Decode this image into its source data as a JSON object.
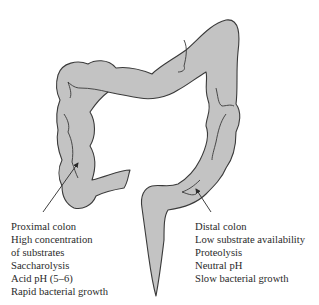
{
  "diagram": {
    "colors": {
      "fill": "#c3c3c3",
      "outline": "#3a3a3a",
      "text": "#2a2a2a"
    },
    "proximal": {
      "lines": [
        "Proximal colon",
        "High concentration",
        "of substrates",
        "Saccharolysis",
        "Acid pH (5–6)",
        "Rapid bacterial growth"
      ]
    },
    "distal": {
      "lines": [
        "Distal colon",
        "Low substrate availability",
        "Proteolysis",
        "Neutral pH",
        "Slow bacterial growth"
      ]
    }
  }
}
